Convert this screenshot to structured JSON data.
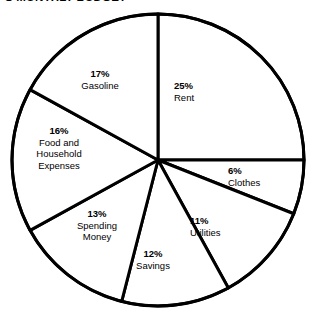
{
  "chart_data": {
    "type": "pie",
    "title": "'S MONTHLY BUDGET",
    "xlabel": "",
    "ylabel": "",
    "legend": "none",
    "grid": false,
    "units": "percent",
    "start_angle_deg": 0,
    "direction": "clockwise",
    "categories": [
      "Rent",
      "Clothes",
      "Utilities",
      "Savings",
      "Spending Money",
      "Food and Household Expenses",
      "Gasoline"
    ],
    "values": [
      25,
      6,
      11,
      12,
      13,
      16,
      17
    ],
    "total": 100,
    "slices": [
      {
        "label": "Rent",
        "value": 25,
        "pct_text": "25%",
        "name_text": "Rent"
      },
      {
        "label": "Clothes",
        "value": 6,
        "pct_text": "6%",
        "name_text": "Clothes"
      },
      {
        "label": "Utilities",
        "value": 11,
        "pct_text": "11%",
        "name_text": "Utilities"
      },
      {
        "label": "Savings",
        "value": 12,
        "pct_text": "12%",
        "name_text": "Savings"
      },
      {
        "label": "Spending Money",
        "value": 13,
        "pct_text": "13%",
        "name_text": "Spending\nMoney"
      },
      {
        "label": "Food and Household Expenses",
        "value": 16,
        "pct_text": "16%",
        "name_text": "Food and\nHousehold\nExpenses"
      },
      {
        "label": "Gasoline",
        "value": 17,
        "pct_text": "17%",
        "name_text": "Gasoline"
      }
    ],
    "colors": {
      "slice_fill": "#ffffff",
      "outline": "#000000",
      "text": "#000000",
      "background": "#ffffff"
    },
    "geometry": {
      "center_x": 158,
      "center_y": 160,
      "radius": 146,
      "stroke_width": 3
    }
  }
}
